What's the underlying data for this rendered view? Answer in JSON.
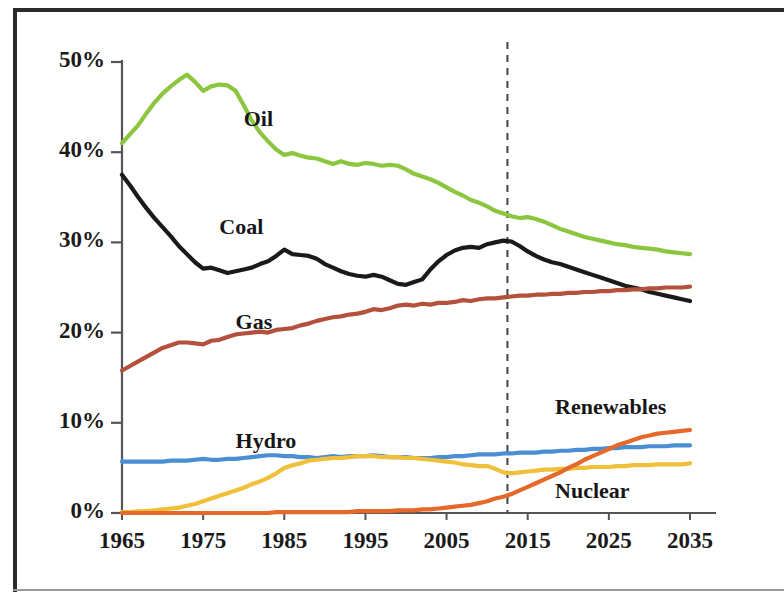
{
  "chart_data": {
    "type": "line",
    "title": "",
    "subtitle": "",
    "xlabel": "",
    "ylabel": "",
    "xlim": [
      1965,
      2035
    ],
    "ylim": [
      0,
      50
    ],
    "grid": false,
    "legend_position": "inline-labels",
    "y_tick_labels": [
      "0%",
      "10%",
      "20%",
      "30%",
      "40%",
      "50%"
    ],
    "y_ticks": [
      0,
      10,
      20,
      30,
      40,
      50
    ],
    "x_tick_labels": [
      "1965",
      "1975",
      "1985",
      "1995",
      "2005",
      "2015",
      "2025",
      "2035"
    ],
    "x_ticks": [
      1965,
      1975,
      1985,
      1995,
      2005,
      2015,
      2025,
      2035
    ],
    "annotations": [
      {
        "name": "forecast-divider",
        "type": "vertical-dashed-line",
        "x": 2012.5,
        "color": "#444444"
      }
    ],
    "series": [
      {
        "name": "Oil",
        "color": "#8cc63f",
        "label_x": 1980,
        "label_y": 43.5,
        "x": [
          1965,
          1966,
          1967,
          1968,
          1969,
          1970,
          1971,
          1972,
          1973,
          1974,
          1975,
          1976,
          1977,
          1978,
          1979,
          1980,
          1981,
          1982,
          1983,
          1984,
          1985,
          1986,
          1987,
          1988,
          1989,
          1990,
          1991,
          1992,
          1993,
          1994,
          1995,
          1996,
          1997,
          1998,
          1999,
          2000,
          2001,
          2002,
          2003,
          2004,
          2005,
          2006,
          2007,
          2008,
          2009,
          2010,
          2011,
          2012,
          2013,
          2014,
          2015,
          2016,
          2017,
          2018,
          2019,
          2020,
          2021,
          2022,
          2023,
          2024,
          2025,
          2026,
          2027,
          2028,
          2029,
          2030,
          2031,
          2032,
          2033,
          2034,
          2035
        ],
        "y": [
          41.0,
          42.0,
          43.0,
          44.3,
          45.5,
          46.5,
          47.3,
          48.0,
          48.6,
          47.8,
          46.8,
          47.3,
          47.5,
          47.4,
          46.8,
          45.2,
          43.5,
          42.2,
          41.2,
          40.3,
          39.7,
          39.9,
          39.6,
          39.4,
          39.3,
          39.0,
          38.7,
          39.0,
          38.7,
          38.6,
          38.8,
          38.7,
          38.5,
          38.6,
          38.5,
          38.1,
          37.6,
          37.3,
          37.0,
          36.6,
          36.1,
          35.6,
          35.2,
          34.7,
          34.4,
          34.0,
          33.5,
          33.2,
          32.9,
          32.7,
          32.8,
          32.6,
          32.3,
          31.9,
          31.5,
          31.2,
          30.9,
          30.6,
          30.4,
          30.2,
          30.0,
          29.8,
          29.7,
          29.5,
          29.4,
          29.3,
          29.2,
          29.0,
          28.9,
          28.8,
          28.7
        ]
      },
      {
        "name": "Coal",
        "color": "#1a1a1a",
        "label_x": 1977,
        "label_y": 31.5,
        "x": [
          1965,
          1966,
          1967,
          1968,
          1969,
          1970,
          1971,
          1972,
          1973,
          1974,
          1975,
          1976,
          1977,
          1978,
          1979,
          1980,
          1981,
          1982,
          1983,
          1984,
          1985,
          1986,
          1987,
          1988,
          1989,
          1990,
          1991,
          1992,
          1993,
          1994,
          1995,
          1996,
          1997,
          1998,
          1999,
          2000,
          2001,
          2002,
          2003,
          2004,
          2005,
          2006,
          2007,
          2008,
          2009,
          2010,
          2011,
          2012,
          2013,
          2014,
          2015,
          2016,
          2017,
          2018,
          2019,
          2020,
          2021,
          2022,
          2023,
          2024,
          2025,
          2026,
          2027,
          2028,
          2029,
          2030,
          2031,
          2032,
          2033,
          2034,
          2035
        ],
        "y": [
          37.5,
          36.3,
          35.0,
          33.8,
          32.7,
          31.7,
          30.7,
          29.6,
          28.7,
          27.8,
          27.1,
          27.2,
          26.9,
          26.6,
          26.8,
          27.0,
          27.2,
          27.6,
          27.9,
          28.5,
          29.2,
          28.7,
          28.6,
          28.5,
          28.2,
          27.6,
          27.2,
          26.8,
          26.5,
          26.3,
          26.2,
          26.4,
          26.2,
          25.8,
          25.4,
          25.3,
          25.6,
          25.9,
          27.0,
          27.9,
          28.6,
          29.1,
          29.4,
          29.5,
          29.4,
          29.8,
          30.0,
          30.2,
          30.1,
          29.6,
          29.0,
          28.5,
          28.1,
          27.8,
          27.6,
          27.3,
          27.0,
          26.7,
          26.4,
          26.1,
          25.8,
          25.5,
          25.2,
          25.0,
          24.8,
          24.5,
          24.3,
          24.1,
          23.9,
          23.7,
          23.5
        ]
      },
      {
        "name": "Gas",
        "color": "#b4513c",
        "label_x": 1979,
        "label_y": 21.0,
        "x": [
          1965,
          1966,
          1967,
          1968,
          1969,
          1970,
          1971,
          1972,
          1973,
          1974,
          1975,
          1976,
          1977,
          1978,
          1979,
          1980,
          1981,
          1982,
          1983,
          1984,
          1985,
          1986,
          1987,
          1988,
          1989,
          1990,
          1991,
          1992,
          1993,
          1994,
          1995,
          1996,
          1997,
          1998,
          1999,
          2000,
          2001,
          2002,
          2003,
          2004,
          2005,
          2006,
          2007,
          2008,
          2009,
          2010,
          2011,
          2012,
          2013,
          2014,
          2015,
          2016,
          2017,
          2018,
          2019,
          2020,
          2021,
          2022,
          2023,
          2024,
          2025,
          2026,
          2027,
          2028,
          2029,
          2030,
          2031,
          2032,
          2033,
          2034,
          2035
        ],
        "y": [
          15.8,
          16.3,
          16.8,
          17.3,
          17.8,
          18.3,
          18.6,
          18.9,
          18.9,
          18.8,
          18.7,
          19.1,
          19.2,
          19.5,
          19.8,
          19.9,
          20.0,
          20.1,
          20.0,
          20.3,
          20.4,
          20.5,
          20.8,
          21.0,
          21.3,
          21.5,
          21.7,
          21.8,
          22.0,
          22.1,
          22.3,
          22.6,
          22.5,
          22.7,
          23.0,
          23.1,
          23.0,
          23.2,
          23.1,
          23.3,
          23.3,
          23.4,
          23.6,
          23.5,
          23.7,
          23.8,
          23.8,
          23.9,
          24.0,
          24.1,
          24.1,
          24.2,
          24.2,
          24.3,
          24.3,
          24.4,
          24.4,
          24.5,
          24.5,
          24.6,
          24.6,
          24.7,
          24.7,
          24.8,
          24.8,
          24.9,
          24.9,
          25.0,
          25.0,
          25.0,
          25.1
        ]
      },
      {
        "name": "Hydro",
        "color": "#4a8fd4",
        "label_x": 1979,
        "label_y": 7.8,
        "x": [
          1965,
          1966,
          1967,
          1968,
          1969,
          1970,
          1971,
          1972,
          1973,
          1974,
          1975,
          1976,
          1977,
          1978,
          1979,
          1980,
          1981,
          1982,
          1983,
          1984,
          1985,
          1986,
          1987,
          1988,
          1989,
          1990,
          1991,
          1992,
          1993,
          1994,
          1995,
          1996,
          1997,
          1998,
          1999,
          2000,
          2001,
          2002,
          2003,
          2004,
          2005,
          2006,
          2007,
          2008,
          2009,
          2010,
          2011,
          2012,
          2013,
          2014,
          2015,
          2016,
          2017,
          2018,
          2019,
          2020,
          2021,
          2022,
          2023,
          2024,
          2025,
          2026,
          2027,
          2028,
          2029,
          2030,
          2031,
          2032,
          2033,
          2034,
          2035
        ],
        "y": [
          5.7,
          5.7,
          5.7,
          5.7,
          5.7,
          5.7,
          5.8,
          5.8,
          5.8,
          5.9,
          6.0,
          5.9,
          5.9,
          6.0,
          6.0,
          6.1,
          6.2,
          6.3,
          6.4,
          6.4,
          6.3,
          6.3,
          6.2,
          6.2,
          6.1,
          6.2,
          6.3,
          6.2,
          6.3,
          6.3,
          6.3,
          6.4,
          6.3,
          6.2,
          6.2,
          6.2,
          6.1,
          6.1,
          6.1,
          6.2,
          6.2,
          6.3,
          6.3,
          6.4,
          6.5,
          6.5,
          6.5,
          6.6,
          6.6,
          6.7,
          6.7,
          6.7,
          6.8,
          6.8,
          6.9,
          6.9,
          7.0,
          7.0,
          7.1,
          7.1,
          7.2,
          7.2,
          7.3,
          7.3,
          7.3,
          7.4,
          7.4,
          7.4,
          7.5,
          7.5,
          7.5
        ]
      },
      {
        "name": "Nuclear",
        "color": "#f0c03a",
        "label_x": 2027,
        "label_y": 2.2,
        "x": [
          1965,
          1966,
          1967,
          1968,
          1969,
          1970,
          1971,
          1972,
          1973,
          1974,
          1975,
          1976,
          1977,
          1978,
          1979,
          1980,
          1981,
          1982,
          1983,
          1984,
          1985,
          1986,
          1987,
          1988,
          1989,
          1990,
          1991,
          1992,
          1993,
          1994,
          1995,
          1996,
          1997,
          1998,
          1999,
          2000,
          2001,
          2002,
          2003,
          2004,
          2005,
          2006,
          2007,
          2008,
          2009,
          2010,
          2011,
          2012,
          2013,
          2014,
          2015,
          2016,
          2017,
          2018,
          2019,
          2020,
          2021,
          2022,
          2023,
          2024,
          2025,
          2026,
          2027,
          2028,
          2029,
          2030,
          2031,
          2032,
          2033,
          2034,
          2035
        ],
        "y": [
          0.1,
          0.1,
          0.2,
          0.2,
          0.3,
          0.4,
          0.5,
          0.6,
          0.8,
          1.0,
          1.3,
          1.6,
          1.9,
          2.2,
          2.5,
          2.8,
          3.2,
          3.5,
          3.9,
          4.4,
          5.0,
          5.3,
          5.5,
          5.8,
          5.9,
          6.0,
          6.1,
          6.1,
          6.2,
          6.3,
          6.3,
          6.3,
          6.2,
          6.2,
          6.2,
          6.1,
          6.1,
          6.0,
          5.9,
          5.8,
          5.7,
          5.6,
          5.4,
          5.3,
          5.2,
          5.2,
          4.9,
          4.5,
          4.4,
          4.5,
          4.6,
          4.7,
          4.8,
          4.8,
          4.9,
          4.9,
          5.0,
          5.0,
          5.1,
          5.1,
          5.1,
          5.2,
          5.2,
          5.3,
          5.3,
          5.3,
          5.4,
          5.4,
          5.4,
          5.4,
          5.5
        ]
      },
      {
        "name": "Renewables",
        "color": "#e4692a",
        "label_x": 2027,
        "label_y": 11.5,
        "x": [
          1965,
          1966,
          1967,
          1968,
          1969,
          1970,
          1971,
          1972,
          1973,
          1974,
          1975,
          1976,
          1977,
          1978,
          1979,
          1980,
          1981,
          1982,
          1983,
          1984,
          1985,
          1986,
          1987,
          1988,
          1989,
          1990,
          1991,
          1992,
          1993,
          1994,
          1995,
          1996,
          1997,
          1998,
          1999,
          2000,
          2001,
          2002,
          2003,
          2004,
          2005,
          2006,
          2007,
          2008,
          2009,
          2010,
          2011,
          2012,
          2013,
          2014,
          2015,
          2016,
          2017,
          2018,
          2019,
          2020,
          2021,
          2022,
          2023,
          2024,
          2025,
          2026,
          2027,
          2028,
          2029,
          2030,
          2031,
          2032,
          2033,
          2034,
          2035
        ],
        "y": [
          0.0,
          0.0,
          0.0,
          0.0,
          0.0,
          0.0,
          0.0,
          0.0,
          0.0,
          0.0,
          0.0,
          0.0,
          0.0,
          0.0,
          0.0,
          0.0,
          0.0,
          0.0,
          0.0,
          0.1,
          0.1,
          0.1,
          0.1,
          0.1,
          0.1,
          0.1,
          0.1,
          0.1,
          0.1,
          0.2,
          0.2,
          0.2,
          0.2,
          0.2,
          0.3,
          0.3,
          0.3,
          0.4,
          0.4,
          0.5,
          0.6,
          0.7,
          0.8,
          0.9,
          1.1,
          1.3,
          1.6,
          1.8,
          2.1,
          2.5,
          2.9,
          3.3,
          3.7,
          4.1,
          4.5,
          5.0,
          5.4,
          5.9,
          6.3,
          6.7,
          7.1,
          7.5,
          7.8,
          8.1,
          8.4,
          8.6,
          8.8,
          8.9,
          9.0,
          9.1,
          9.2
        ]
      }
    ]
  }
}
